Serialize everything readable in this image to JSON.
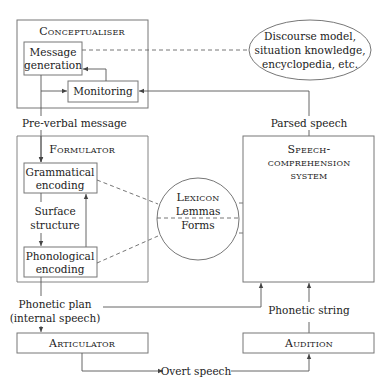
{
  "diagram": {
    "conceptualiser": {
      "title": "Conceptualiser",
      "message_generation": [
        "Message",
        "generation"
      ],
      "monitoring": "Monitoring"
    },
    "knowledge": [
      "Discourse model,",
      "situation knowledge,",
      "encyclopedia, etc."
    ],
    "preverbal_message": "Pre-verbal message",
    "parsed_speech": "Parsed speech",
    "formulator": {
      "title": "Formulator",
      "grammatical_encoding": [
        "Grammatical",
        "encoding"
      ],
      "surface_structure": [
        "Surface",
        "structure"
      ],
      "phonological_encoding": [
        "Phonological",
        "encoding"
      ]
    },
    "lexicon": {
      "title": "Lexicon",
      "lemmas": "Lemmas",
      "forms": "Forms"
    },
    "speech_comprehension": [
      "Speech-",
      "comprehension",
      "system"
    ],
    "phonetic_plan": [
      "Phonetic plan",
      "(internal speech)"
    ],
    "phonetic_string": "Phonetic string",
    "articulator": "Articulator",
    "audition": "Audition",
    "overt_speech": "Overt speech"
  }
}
